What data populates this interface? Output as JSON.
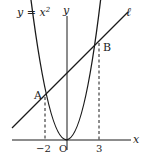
{
  "figure": {
    "curve_label": "y = x²",
    "curve_label_base": "y = x",
    "curve_label_exp": "2",
    "line_label": "ℓ",
    "x_axis_label": "x",
    "y_axis_label": "y",
    "origin_label": "O",
    "point_a_label": "A",
    "point_b_label": "B",
    "tick_neg2": "−2",
    "tick_3": "3"
  },
  "math": {
    "parabola": "y = x^2",
    "line": "y = x + 6",
    "point_A": [
      -2,
      4
    ],
    "point_B": [
      3,
      9
    ]
  },
  "colors": {
    "stroke": "#1a1a1a",
    "background": "#ffffff"
  }
}
